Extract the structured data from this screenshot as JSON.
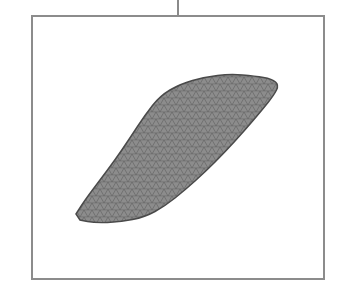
{
  "figure": {
    "connector": {
      "x": 178,
      "y_start": 0,
      "y_end": 15
    },
    "frame": {
      "left": 31,
      "top": 15,
      "right": 323,
      "bottom": 278,
      "border_color": "#8c8c8c"
    },
    "object": {
      "type": "triangulated-mesh-surface",
      "fill_color": "#8a8a8a",
      "edge_color": "#5a5a5a",
      "outline": [
        [
          76,
          214
        ],
        [
          85,
          200
        ],
        [
          100,
          180
        ],
        [
          115,
          160
        ],
        [
          130,
          138
        ],
        [
          145,
          115
        ],
        [
          160,
          96
        ],
        [
          180,
          84
        ],
        [
          205,
          77
        ],
        [
          230,
          74
        ],
        [
          255,
          76
        ],
        [
          272,
          79
        ],
        [
          279,
          85
        ],
        [
          274,
          95
        ],
        [
          262,
          110
        ],
        [
          245,
          130
        ],
        [
          225,
          152
        ],
        [
          205,
          172
        ],
        [
          185,
          190
        ],
        [
          165,
          206
        ],
        [
          145,
          217
        ],
        [
          120,
          222
        ],
        [
          95,
          223
        ],
        [
          80,
          220
        ]
      ]
    }
  }
}
